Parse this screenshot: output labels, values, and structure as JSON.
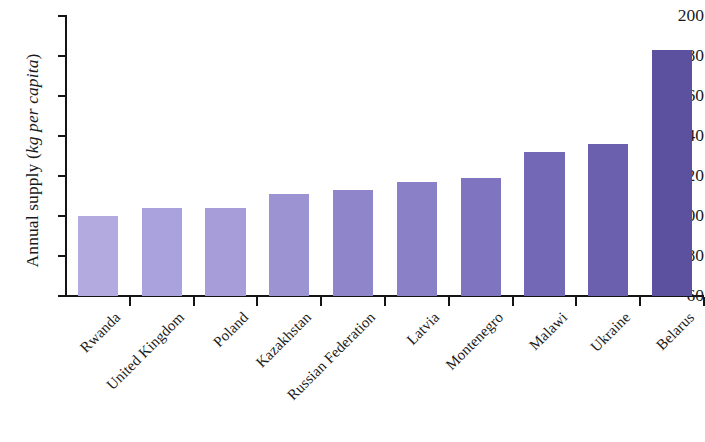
{
  "chart_data": {
    "type": "bar",
    "title": "",
    "xlabel": "",
    "ylabel": "Annual supply (kg per capita)",
    "ylabel_plain": "Annual supply (",
    "ylabel_italic": "kg per capita",
    "ylabel_close": ")",
    "categories": [
      "Rwanda",
      "United Kingdom",
      "Poland",
      "Kazakhstan",
      "Russian Federation",
      "Latvia",
      "Montenegro",
      "Malawi",
      "Ukraine",
      "Belarus"
    ],
    "values": [
      100,
      104,
      104,
      111,
      113,
      117,
      119,
      132,
      136,
      183
    ],
    "bar_colors": [
      "#b3abe0",
      "#aaa2dc",
      "#a69dd9",
      "#9c93d3",
      "#8f85ca",
      "#8a80c7",
      "#7e74bf",
      "#7268b6",
      "#6a60ae",
      "#5b519f"
    ],
    "ylim": [
      60,
      200
    ],
    "yticks": [
      60,
      80,
      100,
      120,
      140,
      160,
      180,
      200
    ],
    "ytick_labels": [
      "60",
      "80",
      "100",
      "120",
      "140",
      "160",
      "180",
      "200"
    ],
    "grid": false,
    "legend": false,
    "axis_color": "#141414"
  }
}
